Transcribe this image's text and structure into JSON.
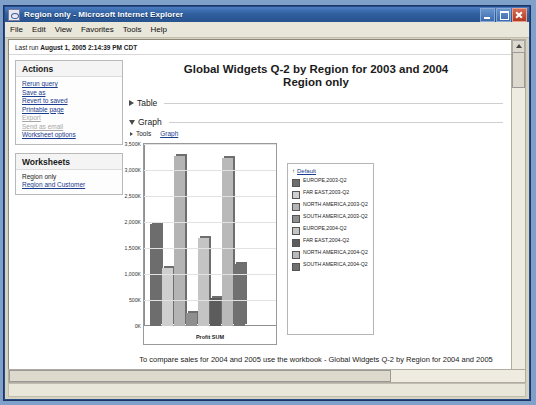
{
  "window": {
    "title": "Region only - Microsoft Internet Explorer",
    "icon": "ie-document-icon",
    "minimize": "Minimize",
    "maximize": "Maximize",
    "close": "Close"
  },
  "menu": [
    "File",
    "Edit",
    "View",
    "Favorites",
    "Tools",
    "Help"
  ],
  "lastrun": {
    "label": "Last run",
    "value": "August 1, 2005 2:14:39 PM CDT"
  },
  "actions": {
    "heading": "Actions",
    "items": [
      {
        "label": "Rerun query",
        "disabled": false
      },
      {
        "label": "Save as",
        "disabled": false
      },
      {
        "label": "Revert to saved",
        "disabled": false
      },
      {
        "label": "Printable page",
        "disabled": false
      },
      {
        "label": "Export",
        "disabled": true
      },
      {
        "label": "Send as email",
        "disabled": true
      },
      {
        "label": "Worksheet options",
        "disabled": false
      }
    ]
  },
  "worksheets": {
    "heading": "Worksheets",
    "items": [
      {
        "label": "Region only",
        "current": true
      },
      {
        "label": "Region and Customer",
        "current": false
      }
    ]
  },
  "report": {
    "title_line1": "Global Widgets Q-2 by Region for 2003 and 2004",
    "title_line2": "Region only",
    "table_section": "Table",
    "graph_section": "Graph",
    "tools_label": "Tools",
    "tools_link": "Graph"
  },
  "legend": {
    "header": "Default",
    "sort_arrow": "↑"
  },
  "footer": {
    "note": "To compare sales for 2004 and 2005 use the workbook - Global Widgets Q-2 by Region for 2004 and 2005",
    "links": [
      "Preferences",
      "Exit",
      "Help"
    ],
    "separator": "|"
  },
  "chart_data": {
    "type": "bar",
    "title": "Global Widgets Q-2 by Region for 2003 and 2004",
    "xlabel": "Profit SUM",
    "ylabel": "",
    "ylim": [
      0,
      3500000
    ],
    "grid": true,
    "legend_position": "right",
    "categories": [
      "EUROPE,2003-Q2",
      "FAR EAST,2003-Q2",
      "NORTH AMERICA,2003-Q2",
      "SOUTH AMERICA,2003-Q2",
      "EUROPE,2004-Q2",
      "FAR EAST,2004-Q2",
      "NORTH AMERICA,2004-Q2",
      "SOUTH AMERICA,2004-Q2"
    ],
    "values": [
      1960000,
      1110000,
      3260000,
      250000,
      1690000,
      530000,
      3230000,
      1200000
    ],
    "colors": [
      "#6d6d6d",
      "#cfcfcf",
      "#b4b4b4",
      "#8f8f8f",
      "#c4c4c4",
      "#5c5c5c",
      "#b9b9b9",
      "#707070"
    ],
    "tick_labels": [
      "3,500K",
      "3,000K",
      "2,500K",
      "2,000K",
      "1,500K",
      "1,000K",
      "500K",
      "0K"
    ],
    "tick_values": [
      3500000,
      3000000,
      2500000,
      2000000,
      1500000,
      1000000,
      500000,
      0
    ]
  }
}
